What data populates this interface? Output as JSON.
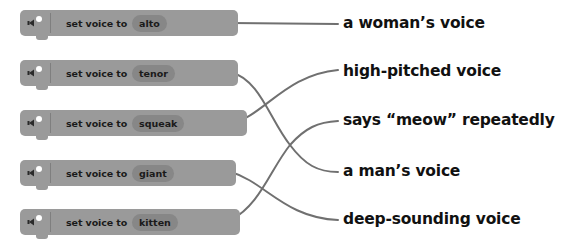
{
  "colors": {
    "block": "#9a9a9a",
    "pill": "#878787",
    "line": "#707070",
    "text": "#111111"
  },
  "blocks": [
    {
      "prefix": "set voice to",
      "value": "alto",
      "icon": "speaker-icon"
    },
    {
      "prefix": "set voice to",
      "value": "tenor",
      "icon": "speaker-icon"
    },
    {
      "prefix": "set voice to",
      "value": "squeak",
      "icon": "speaker-icon"
    },
    {
      "prefix": "set voice to",
      "value": "giant",
      "icon": "speaker-icon"
    },
    {
      "prefix": "set voice to",
      "value": "kitten",
      "icon": "speaker-icon"
    }
  ],
  "answers": [
    {
      "text": "a woman’s voice"
    },
    {
      "text": "high-pitched voice"
    },
    {
      "text": "says “meow” repeatedly"
    },
    {
      "text": "a man’s voice"
    },
    {
      "text": "deep-sounding voice"
    }
  ],
  "matches": [
    {
      "block": "alto",
      "answer": "a woman’s voice"
    },
    {
      "block": "tenor",
      "answer": "a man’s voice"
    },
    {
      "block": "squeak",
      "answer": "high-pitched voice"
    },
    {
      "block": "giant",
      "answer": "deep-sounding voice"
    },
    {
      "block": "kitten",
      "answer": "says “meow” repeatedly"
    }
  ]
}
